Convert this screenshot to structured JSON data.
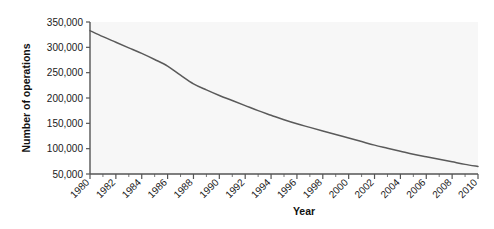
{
  "chart_data": {
    "type": "line",
    "title": "",
    "xlabel": "Year",
    "ylabel": "Number of operations",
    "xlim": [
      1980,
      2010
    ],
    "ylim": [
      50000,
      350000
    ],
    "grid": false,
    "legend": null,
    "x_tick_labels": [
      "1980",
      "1982",
      "1984",
      "1986",
      "1988",
      "1990",
      "1992",
      "1994",
      "1996",
      "1998",
      "2000",
      "2002",
      "2004",
      "2006",
      "2008",
      "2010"
    ],
    "y_tick_labels": [
      "50,000",
      "100,000",
      "150,000",
      "200,000",
      "250,000",
      "300,000",
      "350,000"
    ],
    "y_tick_values": [
      50000,
      100000,
      150000,
      200000,
      250000,
      300000,
      350000
    ],
    "x_minor_ticks_per_interval": 2,
    "series": [
      {
        "name": "Number of operations",
        "color": "#5a5a5a",
        "x": [
          1980,
          1981,
          1982,
          1983,
          1984,
          1985,
          1986,
          1987,
          1988,
          1989,
          1990,
          1991,
          1992,
          1993,
          1994,
          1995,
          1996,
          1997,
          1998,
          1999,
          2000,
          2001,
          2002,
          2003,
          2004,
          2005,
          2006,
          2007,
          2008,
          2009,
          2010
        ],
        "values": [
          333000,
          321000,
          310000,
          299000,
          288000,
          276000,
          263000,
          245000,
          228000,
          216000,
          205000,
          195000,
          185000,
          175000,
          166000,
          157000,
          149000,
          142000,
          135000,
          128000,
          121000,
          114000,
          107000,
          101000,
          95000,
          89000,
          84000,
          79000,
          74000,
          69000,
          65000
        ]
      }
    ]
  }
}
